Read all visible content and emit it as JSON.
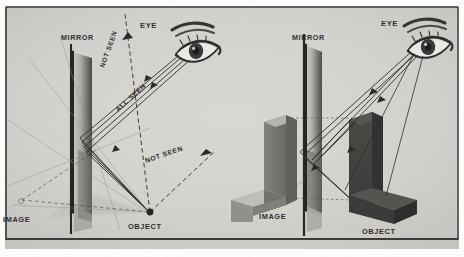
{
  "figure": {
    "background_color": "#d9d7d2",
    "border_color": "#2b2b2b",
    "ink_color": "#1c1c1c"
  },
  "panels": [
    {
      "id": "left-panel",
      "name": "field-of-view-diagram",
      "labels": {
        "mirror": "MIRROR",
        "eye": "EYE",
        "object": "OBJECT",
        "image": "IMAGE",
        "not_seen_upper": "NOT SEEN",
        "all_seen": "ALL SEEN",
        "not_seen_lower": "NOT SEEN"
      }
    },
    {
      "id": "right-panel",
      "name": "image-formation-diagram",
      "labels": {
        "mirror": "MIRROR",
        "eye": "EYE",
        "object": "OBJECT",
        "image": "IMAGE"
      }
    }
  ],
  "colors": {
    "paper": "#d9d7d2",
    "paper_light": "#e3e1dc",
    "paper_dark": "#c9c7c1",
    "ink": "#1c1c1c",
    "block_dark": "#3a3a3a",
    "block_mid": "#6f6d69",
    "block_light": "#9b9994",
    "mirror_face": "#b8b6b1",
    "mirror_edge": "#1a1a1a"
  }
}
